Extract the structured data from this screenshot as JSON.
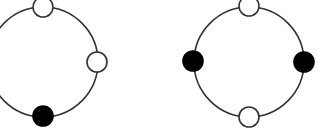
{
  "diagram": {
    "width": 318,
    "height": 132,
    "colors": {
      "stroke": "#333333",
      "filled": "#000000",
      "empty": "#ffffff",
      "background": "#ffffff"
    },
    "rings": [
      {
        "id": "ring-left",
        "cx": 43,
        "cy": 62,
        "r": 55,
        "nodes": [
          {
            "position": "top",
            "cx": 43,
            "cy": 7,
            "filled": false
          },
          {
            "position": "right",
            "cx": 97,
            "cy": 62,
            "filled": false
          },
          {
            "position": "bottom",
            "cx": 43,
            "cy": 116,
            "filled": true
          }
        ]
      },
      {
        "id": "ring-right",
        "cx": 249,
        "cy": 62,
        "r": 55,
        "nodes": [
          {
            "position": "top",
            "cx": 249,
            "cy": 6,
            "filled": false
          },
          {
            "position": "left",
            "cx": 193,
            "cy": 61,
            "filled": true
          },
          {
            "position": "right",
            "cx": 304,
            "cy": 62,
            "filled": true
          },
          {
            "position": "bottom",
            "cx": 249,
            "cy": 117,
            "filled": false
          }
        ]
      }
    ],
    "node_radius": 10
  }
}
